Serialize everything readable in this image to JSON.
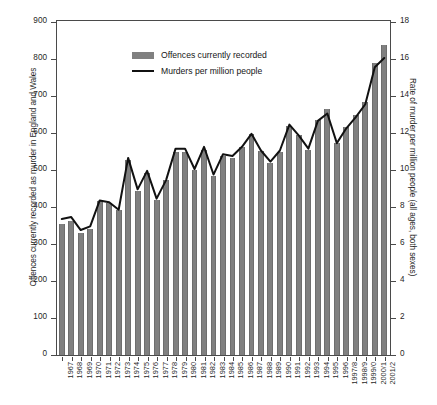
{
  "chart_data": {
    "type": "bar",
    "title": "",
    "subtitle": "",
    "xlabel": "",
    "ylabel": "Offences currently recorded as murder in England and Wales",
    "ylabel_right": "Rate of murder per million people (all ages, both sexes)",
    "ylim": [
      0,
      900
    ],
    "ylim_right": [
      0,
      18
    ],
    "yticks": [
      0,
      100,
      200,
      300,
      400,
      500,
      600,
      700,
      800,
      900
    ],
    "yticks_right": [
      0,
      2,
      4,
      6,
      8,
      10,
      12,
      14,
      16,
      18
    ],
    "grid": false,
    "legend_position": "top-left",
    "categories": [
      "1967",
      "1968",
      "1969",
      "1970",
      "1971",
      "1972",
      "1973",
      "1974",
      "1975",
      "1976",
      "1977",
      "1978",
      "1979",
      "1980",
      "1981",
      "1982",
      "1983",
      "1984",
      "1985",
      "1986",
      "1987",
      "1988",
      "1989",
      "1990",
      "1991",
      "1992",
      "1993",
      "1994",
      "1995",
      "1996",
      "1997/8",
      "1998/9",
      "1999/0",
      "2000/1",
      "2001/2"
    ],
    "series": [
      {
        "name": "Offences currently recorded",
        "type": "bar",
        "axis": "left",
        "color": "#808080",
        "values": [
          354,
          362,
          331,
          340,
          415,
          412,
          392,
          527,
          444,
          493,
          420,
          472,
          549,
          549,
          499,
          553,
          484,
          539,
          533,
          562,
          597,
          551,
          518,
          549,
          620,
          595,
          555,
          634,
          666,
          574,
          615,
          650,
          685,
          788,
          838
        ]
      },
      {
        "name": "Murders per million people",
        "type": "line",
        "axis": "right",
        "color": "#111111",
        "values": [
          7.3,
          7.4,
          6.7,
          6.9,
          8.3,
          8.2,
          7.8,
          10.6,
          8.9,
          9.9,
          8.4,
          9.4,
          11.1,
          11.1,
          10.0,
          11.2,
          9.7,
          10.8,
          10.7,
          11.2,
          11.9,
          11.0,
          10.4,
          11.0,
          12.4,
          11.8,
          11.1,
          12.6,
          13.0,
          11.4,
          12.2,
          12.8,
          13.5,
          15.5,
          16.0
        ]
      }
    ]
  },
  "legend": {
    "items": [
      {
        "label": "Offences currently recorded",
        "marker": "bar-swatch"
      },
      {
        "label": "Murders per million people",
        "marker": "line-swatch"
      }
    ]
  },
  "axes": {
    "left_title": "Offences currently recorded as murder in England and Wales",
    "right_title": "Rate of murder per million people (all ages, both sexes)"
  }
}
